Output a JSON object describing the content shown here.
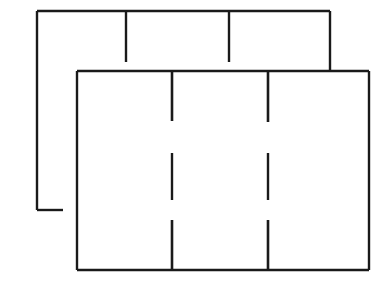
{
  "document": {
    "title": "Floor Plan Line Drawing",
    "kind": "architectural-line-drawing",
    "background_color": "#fefefe",
    "line_color": "#1a1a1a",
    "canvas": {
      "width": 382,
      "height": 285
    }
  },
  "figure": {
    "shape_count": 2,
    "shapes": [
      {
        "id": "back-room",
        "label": "Back Room Outline",
        "z_order": "behind",
        "closed": false,
        "bounds": {
          "x": 37,
          "y": 11,
          "width": 293,
          "height": 199
        },
        "segments": [
          {
            "name": "back-top-wall",
            "x1": 37,
            "y1": 11,
            "x2": 330,
            "y2": 11
          },
          {
            "name": "back-left-wall",
            "x1": 37,
            "y1": 11,
            "x2": 37,
            "y2": 210
          },
          {
            "name": "back-right-wall",
            "x1": 330,
            "y1": 11,
            "x2": 330,
            "y2": 72
          },
          {
            "name": "back-bottom-stub",
            "x1": 37,
            "y1": 210,
            "x2": 63,
            "y2": 210
          }
        ],
        "partitions": [
          {
            "name": "back-partition-1",
            "x1": 126,
            "y1": 11,
            "x2": 126,
            "y2": 62
          },
          {
            "name": "back-partition-2",
            "x1": 229,
            "y1": 11,
            "x2": 229,
            "y2": 62
          }
        ]
      },
      {
        "id": "front-room",
        "label": "Front Room Outline",
        "z_order": "front",
        "closed": true,
        "bounds": {
          "x": 77,
          "y": 71,
          "width": 292,
          "height": 199
        },
        "segments": [
          {
            "name": "front-top-wall",
            "x1": 77,
            "y1": 71,
            "x2": 369,
            "y2": 71
          },
          {
            "name": "front-right-wall",
            "x1": 369,
            "y1": 71,
            "x2": 369,
            "y2": 270
          },
          {
            "name": "front-bottom-wall",
            "x1": 369,
            "y1": 270,
            "x2": 77,
            "y2": 270
          },
          {
            "name": "front-left-wall",
            "x1": 77,
            "y1": 270,
            "x2": 77,
            "y2": 71
          }
        ],
        "partitions": [
          {
            "name": "front-partition-top-left",
            "x1": 172,
            "y1": 71,
            "x2": 172,
            "y2": 121
          },
          {
            "name": "front-partition-top-right",
            "x1": 268,
            "y1": 71,
            "x2": 268,
            "y2": 122
          },
          {
            "name": "front-partition-mid-left",
            "x1": 172,
            "y1": 153,
            "x2": 172,
            "y2": 200
          },
          {
            "name": "front-partition-mid-right",
            "x1": 268,
            "y1": 153,
            "x2": 268,
            "y2": 200
          },
          {
            "name": "front-partition-bottom-left",
            "x1": 172,
            "y1": 220,
            "x2": 172,
            "y2": 270
          },
          {
            "name": "front-partition-bottom-right",
            "x1": 268,
            "y1": 220,
            "x2": 268,
            "y2": 270
          }
        ]
      }
    ]
  }
}
